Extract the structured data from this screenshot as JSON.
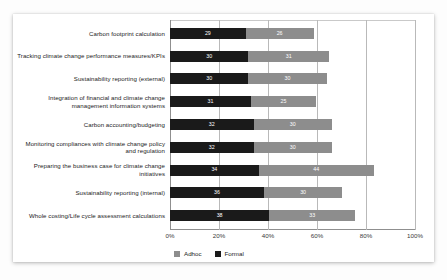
{
  "chart_data": {
    "type": "bar",
    "orientation": "horizontal",
    "stacked": true,
    "title": "",
    "xlabel": "",
    "ylabel": "",
    "xlim": [
      0,
      100
    ],
    "xticks": [
      "0%",
      "20%",
      "40%",
      "60%",
      "80%",
      "100%"
    ],
    "xtick_values": [
      0,
      20,
      40,
      60,
      80,
      100
    ],
    "grid": true,
    "legend_position": "bottom-left",
    "categories": [
      "Carbon footprint calculation",
      "Tracking climate change performance measures/KPIs",
      "Sustainability reporting (external)",
      "Integration of financial and climate change management information systems",
      "Carbon accounting/budgeting",
      "Monitoring compliances with climate change policy and regulation",
      "Preparing the business case for climate change initiatives",
      "Sustainability reporting (internal)",
      "Whole costing/Life cycle assessment calculations"
    ],
    "series": [
      {
        "name": "Formal",
        "color": "#1a1a1a",
        "values": [
          29,
          30,
          30,
          31,
          32,
          32,
          34,
          36,
          38
        ]
      },
      {
        "name": "Adhoc",
        "color": "#8d8d8d",
        "values": [
          26,
          31,
          30,
          25,
          30,
          30,
          44,
          30,
          33
        ]
      }
    ],
    "legend": [
      "Adhoc",
      "Formal"
    ]
  }
}
